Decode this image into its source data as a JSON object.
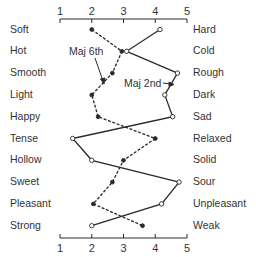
{
  "chart_data": {
    "type": "line",
    "title": "",
    "xlabel": "",
    "ylabel": "",
    "xlim": [
      1,
      5
    ],
    "x_ticks": [
      "1",
      "2",
      "3",
      "4",
      "5"
    ],
    "axis_position": [
      "top",
      "bottom"
    ],
    "grid": false,
    "orientation": "horizontal-profile",
    "categories_left": [
      "Soft",
      "Hot",
      "Smooth",
      "Light",
      "Happy",
      "Tense",
      "Hollow",
      "Sweet",
      "Pleasant",
      "Strong"
    ],
    "categories_right": [
      "Hard",
      "Cold",
      "Rough",
      "Dark",
      "Sad",
      "Relaxed",
      "Solid",
      "Sour",
      "Unpleasant",
      "Weak"
    ],
    "series": [
      {
        "name": "Maj 6th",
        "marker": "filled-circle",
        "line_style": "dashed",
        "values": [
          2.0,
          2.95,
          2.65,
          2.0,
          2.2,
          4.0,
          3.0,
          2.65,
          2.05,
          3.6
        ]
      },
      {
        "name": "Maj 2nd",
        "marker": "open-circle",
        "line_style": "solid",
        "values": [
          4.15,
          3.1,
          4.7,
          4.3,
          4.55,
          1.4,
          2.0,
          4.75,
          4.2,
          2.0
        ]
      }
    ],
    "annotations": [
      {
        "text": "Maj 6th",
        "points_to": "Maj 6th",
        "near": "Smooth"
      },
      {
        "text": "Maj 2nd",
        "points_to": "Maj 2nd",
        "near": "Rough/Dark"
      }
    ],
    "legend": "none (inline annotations)"
  },
  "colors": {
    "line": "#2a2a2a",
    "text": "#333333",
    "background": "#ffffff"
  }
}
